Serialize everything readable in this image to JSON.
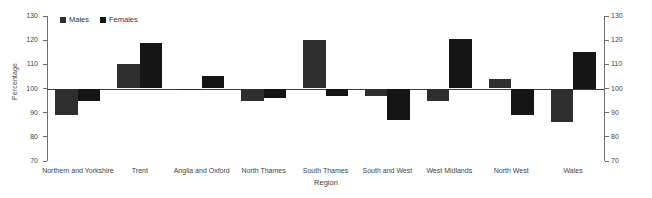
{
  "chart_data": {
    "type": "bar",
    "title": "",
    "xlabel": "Region",
    "ylabel": "Percentage",
    "ylim": [
      70,
      130
    ],
    "yticks": [
      70,
      80,
      90,
      100,
      110,
      120,
      130
    ],
    "grid": false,
    "legend_position": "top-left",
    "baseline": 100,
    "dual_axis": true,
    "categories": [
      "Northern and Yorkshire",
      "Trent",
      "Anglia and Oxford",
      "North Thames",
      "South Thames",
      "South and West",
      "West Midlands",
      "North West",
      "Wales"
    ],
    "series": [
      {
        "name": "Males",
        "color": "#2e2e2e",
        "values": [
          89,
          110,
          99.5,
          95,
          120,
          97,
          95,
          104,
          86
        ]
      },
      {
        "name": "Females",
        "color": "#151515",
        "values": [
          95,
          119,
          105,
          96,
          97,
          87,
          120.5,
          89,
          115
        ]
      }
    ]
  },
  "legend": {
    "items": [
      {
        "label": "Males",
        "swatch": "males-swatch"
      },
      {
        "label": "Females",
        "swatch": "females-swatch"
      }
    ]
  },
  "axes": {
    "left_title": "Percentage",
    "bottom_title": "Region",
    "tick_labels": [
      "130",
      "120",
      "110",
      "100",
      "90",
      "80",
      "70"
    ]
  },
  "colors": {
    "males": "#2e2e2e",
    "females": "#151515",
    "axis": "#6d6d6d",
    "baseline": "#3d3d3d",
    "text": "#3f3f3f",
    "background": "#ffffff"
  }
}
